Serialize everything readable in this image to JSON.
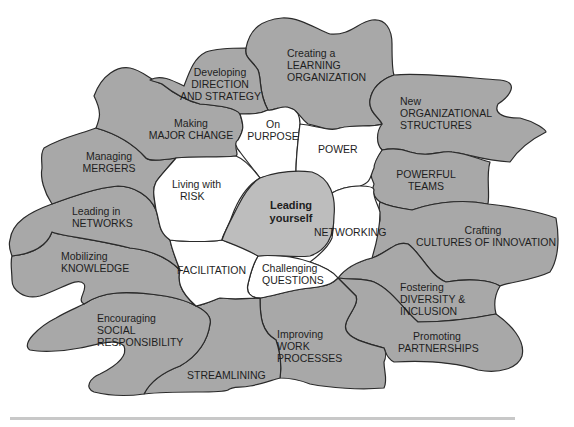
{
  "diagram": {
    "center": {
      "line1": "Leading",
      "line2": "yourself"
    },
    "inner_ring": [
      {
        "id": "on-purpose",
        "line1": "On",
        "line2": "PURPOSE"
      },
      {
        "id": "power",
        "line1": "POWER"
      },
      {
        "id": "networking",
        "line1": "NETWORKING"
      },
      {
        "id": "challenging-questions",
        "line1": "Challenging",
        "line2": "QUESTIONS"
      },
      {
        "id": "facilitation",
        "line1": "FACILITATION"
      },
      {
        "id": "living-with-risk",
        "line1": "Living with",
        "line2": "RISK"
      }
    ],
    "outer_ring": [
      {
        "id": "learning-organization",
        "line1": "Creating a",
        "line2": "LEARNING",
        "line3": "ORGANIZATION"
      },
      {
        "id": "organizational-structures",
        "line1": "New",
        "line2": "ORGANIZATIONAL",
        "line3": "STRUCTURES"
      },
      {
        "id": "powerful-teams",
        "line1": "POWERFUL",
        "line2": "TEAMS"
      },
      {
        "id": "cultures-of-innovation",
        "line1": "Crafting",
        "line2": "CULTURES OF INNOVATION"
      },
      {
        "id": "diversity-inclusion",
        "line1": "Fostering",
        "line2": "DIVERSITY &",
        "line3": "INCLUSION"
      },
      {
        "id": "partnerships",
        "line1": "Promoting",
        "line2": "PARTNERSHIPS"
      },
      {
        "id": "work-processes",
        "line1": "Improving",
        "line2": "WORK",
        "line3": "PROCESSES"
      },
      {
        "id": "streamlining",
        "line1": "STREAMLINING"
      },
      {
        "id": "social-responsibility",
        "line1": "Encouraging",
        "line2": "SOCIAL",
        "line3": "RESPONSIBILITY"
      },
      {
        "id": "mobilizing-knowledge",
        "line1": "Mobilizing",
        "line2": "KNOWLEDGE"
      },
      {
        "id": "leading-in-networks",
        "line1": "Leading in",
        "line2": "NETWORKS"
      },
      {
        "id": "managing-mergers",
        "line1": "Managing",
        "line2": "MERGERS"
      },
      {
        "id": "major-change",
        "line1": "Making",
        "line2": "MAJOR CHANGE"
      },
      {
        "id": "direction-strategy",
        "line1": "Developing",
        "line2": "DIRECTION",
        "line3": "AND STRATEGY"
      }
    ],
    "colors": {
      "outer_fill": "#a8a8a8",
      "inner_fill": "#ffffff",
      "center_fill": "#bdbdbd",
      "stroke": "#2a2a2a",
      "rule": "#c8c8c8"
    }
  }
}
